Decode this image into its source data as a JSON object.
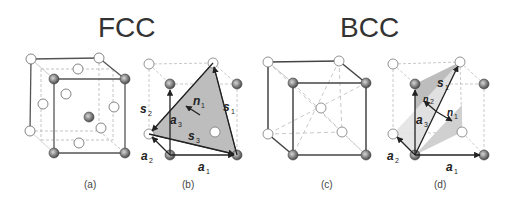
{
  "titles": {
    "fcc": "FCC",
    "bcc": "BCC"
  },
  "panels": [
    {
      "id": "a",
      "caption": "(a)",
      "structure": "FCC",
      "description": "FCC unit cell with corner and face-centered atoms"
    },
    {
      "id": "b",
      "caption": "(b)",
      "structure": "FCC",
      "description": "FCC slip plane with lattice and slip vectors"
    },
    {
      "id": "c",
      "caption": "(c)",
      "structure": "BCC",
      "description": "BCC unit cell with corner and body-centered atom"
    },
    {
      "id": "d",
      "caption": "(d)",
      "structure": "BCC",
      "description": "BCC slip planes with lattice and slip vectors"
    }
  ],
  "vector_labels": {
    "b": {
      "a1": {
        "base": "a",
        "sub": "1"
      },
      "a2": {
        "base": "a",
        "sub": "2"
      },
      "a3": {
        "base": "a",
        "sub": "3"
      },
      "s1": {
        "base": "s",
        "sub": "1"
      },
      "s2": {
        "base": "s",
        "sub": "2"
      },
      "s3": {
        "base": "s",
        "sub": "3"
      },
      "n1": {
        "base": "n",
        "sub": "1"
      }
    },
    "d": {
      "a1": {
        "base": "a",
        "sub": "1"
      },
      "a2": {
        "base": "a",
        "sub": "2"
      },
      "a3": {
        "base": "a",
        "sub": "3"
      },
      "s1": {
        "base": "s",
        "sub": "1"
      },
      "n1": {
        "base": "n",
        "sub": "1"
      },
      "n2": {
        "base": "n",
        "sub": "2"
      }
    }
  },
  "colors": {
    "plane_fill": "#bdbdbd",
    "plane_fill_light": "#d9d9d9",
    "atom_dark": "#7a7a7a",
    "atom_open": "#ffffff",
    "edge_solid": "#555555",
    "edge_dashed": "#b5b5b5"
  }
}
